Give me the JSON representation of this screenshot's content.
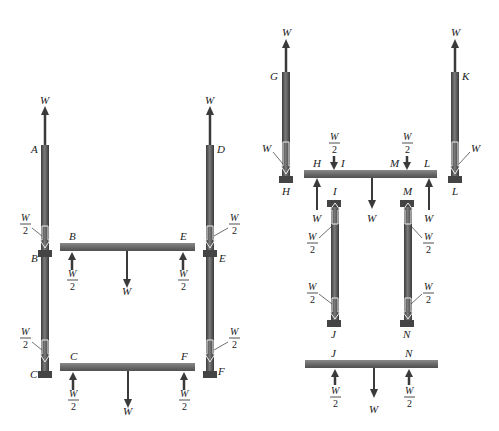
{
  "diagram": {
    "type": "free-body diagram",
    "colors": {
      "rod": "#555555",
      "rod_highlight": "#8a8a8a",
      "bar": "#6e6e6e",
      "arrow": "#3a3a3a",
      "text": "#222222"
    },
    "left_assembly": {
      "rods": [
        {
          "id": "AC",
          "top_label": "A",
          "mid_label": "B",
          "bottom_label": "C",
          "top_force": "W"
        },
        {
          "id": "DF",
          "top_label": "D",
          "mid_label": "E",
          "bottom_label": "F",
          "top_force": "W"
        }
      ],
      "bars": [
        {
          "id": "BE",
          "left_label": "B",
          "right_label": "E",
          "left_reaction": "W/2",
          "right_reaction": "W/2",
          "load": "W"
        },
        {
          "id": "CF",
          "left_label": "C",
          "right_label": "F",
          "left_reaction": "W/2",
          "right_reaction": "W/2",
          "load": "W"
        }
      ],
      "rod_internal_forces": [
        {
          "rod": "AC",
          "segment": "upper",
          "value": "W/2"
        },
        {
          "rod": "AC",
          "segment": "lower",
          "value": "W/2"
        },
        {
          "rod": "DF",
          "segment": "upper",
          "value": "W/2"
        },
        {
          "rod": "DF",
          "segment": "lower",
          "value": "W/2"
        }
      ]
    },
    "right_assembly": {
      "outer_rods": [
        {
          "id": "GH",
          "top_label": "G",
          "bottom_label": "H",
          "top_force": "W",
          "internal_force": "W"
        },
        {
          "id": "KL",
          "top_label": "K",
          "bottom_label": "L",
          "top_force": "W",
          "internal_force": "W"
        }
      ],
      "upper_bar": {
        "id": "HL",
        "labels": [
          "H",
          "I",
          "M",
          "L"
        ],
        "down_loads": [
          "W/2",
          "W/2"
        ],
        "up_reactions": [
          "W",
          "W"
        ],
        "center_load": "W"
      },
      "inner_rods": [
        {
          "id": "IJ",
          "top_label": "I",
          "bottom_label": "J",
          "upper_force": "W/2",
          "lower_force": "W/2"
        },
        {
          "id": "MN",
          "top_label": "M",
          "bottom_label": "N",
          "upper_force": "W/2",
          "lower_force": "W/2"
        }
      ],
      "lower_bar": {
        "id": "JN",
        "left_label": "J",
        "right_label": "N",
        "left_reaction": "W/2",
        "right_reaction": "W/2",
        "load": "W"
      }
    },
    "symbols": {
      "W": "W",
      "half_num": "W",
      "half_den": "2"
    }
  }
}
